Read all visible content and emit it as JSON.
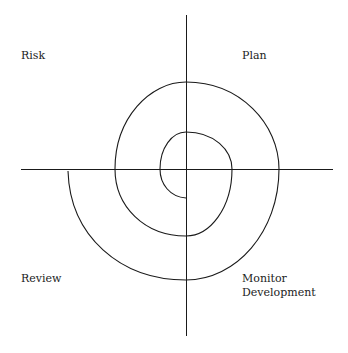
{
  "diagram": {
    "quadrants": {
      "top_left": "Risk",
      "top_right": "Plan",
      "bottom_left": "Review",
      "bottom_right_line1": "Monitor",
      "bottom_right_line2": "Development"
    },
    "colors": {
      "line": "#1a1a1a",
      "background": "#ffffff",
      "text": "#222222"
    }
  }
}
